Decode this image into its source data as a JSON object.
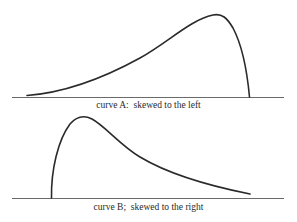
{
  "diagram": {
    "panels": [
      {
        "id": "A",
        "caption": "curve A:  skewed to the left",
        "shape": "left-skewed distribution (long tail to the left, peak near right)"
      },
      {
        "id": "B",
        "caption": "curve B;  skewed to the right",
        "shape": "right-skewed distribution (peak near left, long tail to the right)"
      }
    ],
    "colors": {
      "curve": "#2a2a2a",
      "axis": "#6a6a6a",
      "background": "#ffffff"
    }
  }
}
